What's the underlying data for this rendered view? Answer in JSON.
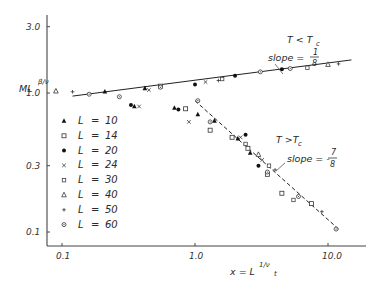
{
  "chart_data": {
    "type": "scatter",
    "title": "",
    "xlabel": "x = L^(1/ν_t)",
    "ylabel": "M L^(β/ν)",
    "xscale": "log",
    "yscale": "log",
    "xlim": [
      0.085,
      20
    ],
    "ylim": [
      0.08,
      3.5
    ],
    "grid": false,
    "legend_position": "left-middle",
    "x_ticks": [
      {
        "value": 0.1,
        "label": "0.1"
      },
      {
        "value": 1.0,
        "label": "1.0"
      },
      {
        "value": 10.0,
        "label": "10.0"
      }
    ],
    "y_ticks": [
      {
        "value": 3.0,
        "label": "3.0"
      },
      {
        "value": 1.0,
        "label": "1.0"
      },
      {
        "value": 0.3,
        "label": "0.3"
      },
      {
        "value": 0.1,
        "label": "0.1"
      }
    ],
    "fit_lines": [
      {
        "name": "T < Tc",
        "style": "solid",
        "slope": "1/8",
        "x": [
          0.12,
          15
        ],
        "y": [
          0.95,
          1.73
        ]
      },
      {
        "name": "T > Tc",
        "style": "dashed",
        "slope": "-7/8",
        "x": [
          1.0,
          12
        ],
        "y": [
          0.88,
          0.105
        ]
      }
    ],
    "annotations": [
      {
        "text": "T < Tc",
        "x": 5.5,
        "y": 2.1
      },
      {
        "text": "slope = 1/8",
        "x": 5.0,
        "y": 1.55
      },
      {
        "text": "T > Tc",
        "x": 3.8,
        "y": 0.42
      },
      {
        "text": "slope = - 7/8",
        "x": 4.6,
        "y": 0.26
      }
    ],
    "series": [
      {
        "name": "L = 10",
        "marker": "filled-triangle",
        "points": [
          [
            0.21,
            1.02
          ],
          [
            0.42,
            1.08
          ],
          [
            0.35,
            0.8
          ],
          [
            0.7,
            0.78
          ],
          [
            1.05,
            0.7
          ],
          [
            1.4,
            0.63
          ],
          [
            2.1,
            0.47
          ],
          [
            2.6,
            0.37
          ]
        ]
      },
      {
        "name": "L = 14",
        "marker": "open-square",
        "points": [
          [
            0.55,
            1.12
          ],
          [
            0.85,
            0.77
          ],
          [
            1.3,
            0.54
          ],
          [
            1.9,
            0.48
          ],
          [
            2.5,
            0.4
          ],
          [
            3.5,
            0.26
          ],
          [
            4.5,
            0.19
          ],
          [
            7.5,
            0.16
          ]
        ]
      },
      {
        "name": "L = 20",
        "marker": "filled-circle",
        "points": [
          [
            0.33,
            0.82
          ],
          [
            0.75,
            0.76
          ],
          [
            1.0,
            1.15
          ],
          [
            2.0,
            1.33
          ],
          [
            2.4,
            0.5
          ],
          [
            3.0,
            0.3
          ],
          [
            4.5,
            1.48
          ]
        ]
      },
      {
        "name": "L = 24",
        "marker": "x",
        "points": [
          [
            0.38,
            0.8
          ],
          [
            0.45,
            1.05
          ],
          [
            0.9,
            0.62
          ],
          [
            1.2,
            1.2
          ],
          [
            2.2,
            0.48
          ],
          [
            3.2,
            0.33
          ]
        ]
      },
      {
        "name": "L = 30",
        "marker": "open-square-small",
        "points": [
          [
            1.6,
            1.26
          ],
          [
            2.4,
            0.43
          ],
          [
            3.6,
            0.3
          ],
          [
            5.5,
            0.17
          ],
          [
            7.0,
            1.52
          ]
        ]
      },
      {
        "name": "L = 40",
        "marker": "open-triangle",
        "points": [
          [
            0.09,
            1.03
          ],
          [
            3.0,
            0.36
          ],
          [
            10.0,
            1.6
          ]
        ]
      },
      {
        "name": "L = 50",
        "marker": "plus",
        "points": [
          [
            0.12,
            1.02
          ],
          [
            1.5,
            1.23
          ],
          [
            4.0,
            0.28
          ],
          [
            9.0,
            0.14
          ],
          [
            12.0,
            1.62
          ]
        ]
      },
      {
        "name": "L = 60",
        "marker": "circle-dot",
        "points": [
          [
            0.16,
            0.98
          ],
          [
            0.27,
            0.94
          ],
          [
            0.55,
            1.1
          ],
          [
            1.05,
            0.88
          ],
          [
            1.3,
            0.62
          ],
          [
            3.1,
            1.42
          ],
          [
            3.5,
            0.27
          ],
          [
            5.2,
            1.5
          ],
          [
            6.0,
            0.18
          ],
          [
            11.5,
            0.105
          ]
        ]
      }
    ]
  },
  "axes": {
    "x_label_main": "x = L",
    "x_label_sup": "1/ν",
    "x_label_sub": "t",
    "y_label_main": "ML",
    "y_label_sup": "β/ν"
  },
  "legend": {
    "items": [
      {
        "label": "L",
        "eq": "=",
        "value": "10"
      },
      {
        "label": "L",
        "eq": "=",
        "value": "14"
      },
      {
        "label": "L",
        "eq": "=",
        "value": "20"
      },
      {
        "label": "L",
        "eq": "=",
        "value": "24"
      },
      {
        "label": "L",
        "eq": "=",
        "value": "30"
      },
      {
        "label": "L",
        "eq": "=",
        "value": "40"
      },
      {
        "label": "L",
        "eq": "=",
        "value": "50"
      },
      {
        "label": "L",
        "eq": "=",
        "value": "60"
      }
    ]
  },
  "annotations_text": {
    "low_T": "T < T",
    "low_T_sub": "c",
    "low_slope_label": "slope =",
    "low_slope_num": "1",
    "low_slope_den": "8",
    "high_T": "T >T",
    "high_T_sub": "c",
    "high_slope_label": "slope = -",
    "high_slope_num": "7",
    "high_slope_den": "8"
  }
}
